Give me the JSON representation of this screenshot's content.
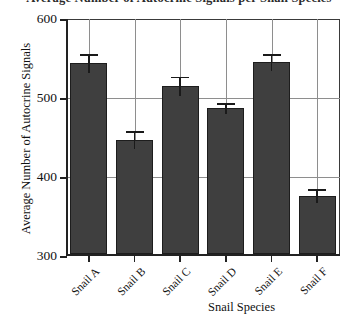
{
  "chart_data": {
    "type": "bar",
    "title": "Average Number of Autocrine Signals per Snail Species",
    "xlabel": "Snail Species",
    "ylabel": "Average Number of Autocrine Signals",
    "categories": [
      "Snail A",
      "Snail B",
      "Snail C",
      "Snail D",
      "Snail E",
      "Snail F"
    ],
    "values": [
      544,
      447,
      515,
      487,
      545,
      376
    ],
    "errors": [
      12,
      11,
      12,
      7,
      11,
      9
    ],
    "ylim": [
      300,
      600
    ],
    "yticks": [
      300,
      400,
      500,
      600
    ],
    "ytick_labels": [
      "300",
      "400",
      "500",
      "600"
    ],
    "grid": "both",
    "legend": "none",
    "bar_color": "#3f3f3f",
    "bar_edge_color": "#1d1d1d",
    "grid_color": "#8e8e8e",
    "axis_color": "#222222"
  }
}
